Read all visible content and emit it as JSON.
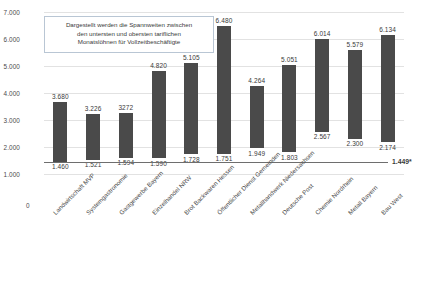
{
  "chart_data": {
    "type": "bar",
    "title": "",
    "subtitle": "",
    "xlabel": "",
    "ylabel": "",
    "ylim": [
      1000,
      7000
    ],
    "yticks": [
      "1.000",
      "2.000",
      "3.000",
      "4.000",
      "5.000",
      "6.000",
      "7.000"
    ],
    "ytick_values": [
      1000,
      2000,
      3000,
      4000,
      5000,
      6000,
      7000
    ],
    "zero_tick_label": "0",
    "grid": true,
    "legend": "none",
    "annotation": {
      "lines": [
        "Dargestellt werden die Spannweiten zwischen",
        "den untersten und obersten tariflichen",
        "Monatslöhnen für Vollzeitbeschäftigte"
      ]
    },
    "reference_line": {
      "label": "1.449*",
      "value": 1449
    },
    "categories": [
      "Landwirtschaft MVP",
      "Systemgastronomie",
      "Gastgewerbe Bayern",
      "Einzelhandel NRW",
      "Brot Backwaren Hessen",
      "Öffentlicher Dienst Gemeinden",
      "Metallhandwerk Niedersachsen",
      "Deutsche Post",
      "Chemie Nordrhein",
      "Metall Bayern",
      "Bau West"
    ],
    "series": [
      {
        "name": "untere tarifliche Monatslöhne",
        "labels": [
          "1.460",
          "1.521",
          "1.594",
          "1.590",
          "1.728",
          "1.751",
          "1.949",
          "1.803",
          "2.567",
          "2.300",
          "2.174"
        ],
        "values": [
          1460,
          1521,
          1594,
          1590,
          1728,
          1751,
          1949,
          1803,
          2567,
          2300,
          2174
        ]
      },
      {
        "name": "obere tarifliche Monatslöhne",
        "labels": [
          "3.680",
          "3.226",
          "3272",
          "4.820",
          "5.105",
          "6.480",
          "4.264",
          "5.051",
          "6.014",
          "5.579",
          "6.134"
        ],
        "values": [
          3680,
          3226,
          3272,
          4820,
          5105,
          6480,
          4264,
          5051,
          6014,
          5579,
          6134
        ]
      }
    ],
    "colors": {
      "bar": "#4a4a4a",
      "grid": "#e2e2e2",
      "baseline": "#6e6e6e",
      "callout_border": "#b9c6d4",
      "text": "#3a3a3a",
      "background": "#ffffff"
    }
  }
}
